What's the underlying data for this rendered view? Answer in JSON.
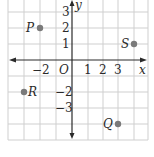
{
  "diagram": {
    "type": "coordinate-plane",
    "axes": {
      "x_label": "x",
      "y_label": "y",
      "origin_label": "O",
      "x_tick_labels": [
        {
          "value": -2,
          "text": "−2"
        },
        {
          "value": 1,
          "text": "1"
        },
        {
          "value": 2,
          "text": "2"
        },
        {
          "value": 3,
          "text": "3"
        }
      ],
      "y_tick_labels": [
        {
          "value": 3,
          "text": "3"
        },
        {
          "value": 2,
          "text": "2"
        },
        {
          "value": 1,
          "text": "1"
        },
        {
          "value": -2,
          "text": "−2"
        },
        {
          "value": -3,
          "text": "−3"
        }
      ]
    },
    "points": [
      {
        "name": "P",
        "x": -2,
        "y": 2
      },
      {
        "name": "S",
        "x": 4,
        "y": 1
      },
      {
        "name": "R",
        "x": -3,
        "y": -2
      },
      {
        "name": "Q",
        "x": 3,
        "y": -4
      }
    ],
    "colors": {
      "grid": "#cfcfcf",
      "axis": "#2a2a2a",
      "point": "#7a7a7a",
      "text": "#2a2a2a"
    }
  }
}
